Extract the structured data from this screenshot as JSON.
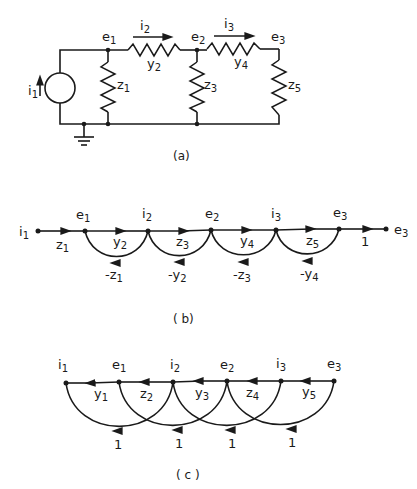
{
  "figure": {
    "panel_a": {
      "caption": "(a)",
      "source": {
        "label": "i",
        "sub": "1"
      },
      "nodes": [
        {
          "label": "e",
          "sub": "1"
        },
        {
          "label": "e",
          "sub": "2"
        },
        {
          "label": "e",
          "sub": "3"
        }
      ],
      "currents": [
        {
          "label": "i",
          "sub": "2"
        },
        {
          "label": "i",
          "sub": "3"
        }
      ],
      "elements": [
        {
          "label": "z",
          "sub": "1"
        },
        {
          "label": "y",
          "sub": "2"
        },
        {
          "label": "z",
          "sub": "3"
        },
        {
          "label": "y",
          "sub": "4"
        },
        {
          "label": "z",
          "sub": "5"
        }
      ]
    },
    "panel_b": {
      "caption": "( b)",
      "nodes": [
        {
          "label": "i",
          "sub": "1"
        },
        {
          "label": "e",
          "sub": "1"
        },
        {
          "label": "i",
          "sub": "2"
        },
        {
          "label": "e",
          "sub": "2"
        },
        {
          "label": "i",
          "sub": "3"
        },
        {
          "label": "e",
          "sub": "3"
        },
        {
          "label": "e",
          "sub": "3"
        }
      ],
      "forward_gains": [
        {
          "label": "z",
          "sub": "1"
        },
        {
          "label": "y",
          "sub": "2"
        },
        {
          "label": "z",
          "sub": "3"
        },
        {
          "label": "y",
          "sub": "4"
        },
        {
          "label": "z",
          "sub": "5"
        },
        {
          "label": "1",
          "sub": ""
        }
      ],
      "feedback_gains": [
        {
          "label": "-z",
          "sub": "1"
        },
        {
          "label": "-y",
          "sub": "2"
        },
        {
          "label": "-z",
          "sub": "3"
        },
        {
          "label": "-y",
          "sub": "4"
        }
      ]
    },
    "panel_c": {
      "caption": "( c )",
      "nodes": [
        {
          "label": "i",
          "sub": "1"
        },
        {
          "label": "e",
          "sub": "1"
        },
        {
          "label": "i",
          "sub": "2"
        },
        {
          "label": "e",
          "sub": "2"
        },
        {
          "label": "i",
          "sub": "3"
        },
        {
          "label": "e",
          "sub": "3"
        }
      ],
      "backward_gains": [
        {
          "label": "y",
          "sub": "1"
        },
        {
          "label": "z",
          "sub": "2"
        },
        {
          "label": "y",
          "sub": "3"
        },
        {
          "label": "z",
          "sub": "4"
        },
        {
          "label": "y",
          "sub": "5"
        }
      ],
      "arc_gains": [
        "1",
        "1",
        "1",
        "1"
      ]
    }
  }
}
